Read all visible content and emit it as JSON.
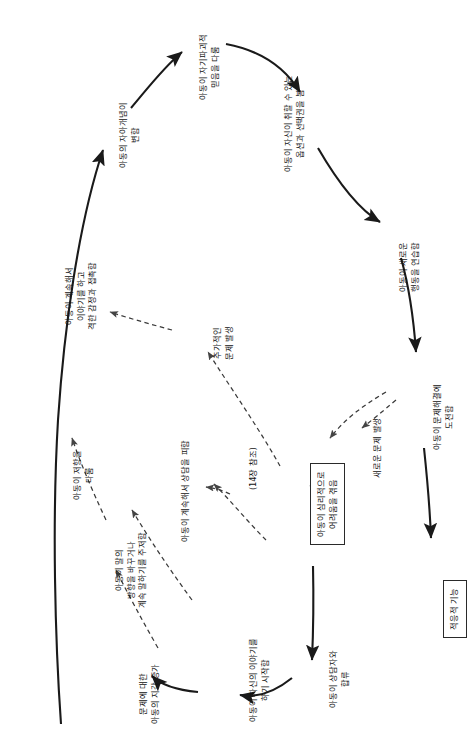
{
  "diagram": {
    "orientation": "rotated-90-ccw",
    "background": "#ffffff",
    "line_color": "#1a1a1a",
    "dashed_color": "#444444",
    "nodes": [
      {
        "id": "n1",
        "lines": [
          "아동의 자아개념이",
          "변함"
        ],
        "boxed": false
      },
      {
        "id": "n2",
        "lines": [
          "아동이 자기파괴적",
          "믿음을 다룸"
        ],
        "boxed": false
      },
      {
        "id": "n3",
        "lines": [
          "아동이 자신이 취할 수 있는",
          "옵션과 선택권을 봄"
        ],
        "boxed": false
      },
      {
        "id": "n4",
        "lines": [
          "아동이 새로운",
          "행동을 연습함"
        ],
        "boxed": false
      },
      {
        "id": "n5",
        "lines": [
          "아동이 문제해결에",
          "도전함"
        ],
        "boxed": false
      },
      {
        "id": "n6",
        "lines": [
          "적응적 기능"
        ],
        "boxed": true
      },
      {
        "id": "n7",
        "lines": [
          "새로운 문제 발생"
        ],
        "boxed": false
      },
      {
        "id": "n8",
        "lines": [
          "아동이 심리적으로",
          "어려움을 겪음"
        ],
        "boxed": true
      },
      {
        "id": "n9",
        "lines": [
          "추가적인",
          "문제 발생"
        ],
        "boxed": false
      },
      {
        "id": "n10",
        "lines": [
          "아동이 계속해서",
          "이야기를 하고",
          "격한 감정과 접촉함"
        ],
        "boxed": false
      },
      {
        "id": "n11",
        "lines": [
          "아동이 저항을",
          "다룸"
        ],
        "boxed": false
      },
      {
        "id": "n12",
        "lines": [
          "아동이 계속해서 상담을 피함"
        ],
        "boxed": false
      },
      {
        "id": "n13",
        "lines": [
          "(14장 참조)"
        ],
        "boxed": false
      },
      {
        "id": "n14",
        "lines": [
          "아동이 말의",
          "방향을 바꾸거나",
          "계속 말하기를 주저함"
        ],
        "boxed": false
      },
      {
        "id": "n15",
        "lines": [
          "문제에 대한",
          "아동의 지각 증가"
        ],
        "boxed": false
      },
      {
        "id": "n16",
        "lines": [
          "아동이 자신의 이야기를",
          "하기 시작함"
        ],
        "boxed": false
      },
      {
        "id": "n17",
        "lines": [
          "아동이 상담자와",
          "합류"
        ],
        "boxed": false
      }
    ]
  }
}
